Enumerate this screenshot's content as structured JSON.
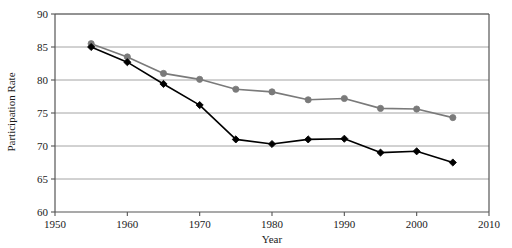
{
  "chart_data": {
    "type": "line",
    "title": "",
    "subtitle": "",
    "xlabel": "Year",
    "ylabel": "Participation Rate",
    "xlim": [
      1950,
      2010
    ],
    "ylim": [
      60,
      90
    ],
    "xticks": [
      1950,
      1960,
      1970,
      1980,
      1990,
      2000,
      2010
    ],
    "xtick_labels": [
      "1950",
      "1960",
      "1970",
      "1980",
      "1990",
      "2000",
      "2010"
    ],
    "yticks": [
      60,
      65,
      70,
      75,
      80,
      85,
      90
    ],
    "ytick_labels": [
      "60",
      "65",
      "70",
      "75",
      "80",
      "85",
      "90"
    ],
    "grid": "horizontal",
    "legend": "none",
    "x": [
      1955,
      1960,
      1965,
      1970,
      1975,
      1980,
      1985,
      1990,
      1995,
      2000,
      2005
    ],
    "series": [
      {
        "name": "gray-series",
        "color": "#7a7a7a",
        "marker": "circle",
        "values": [
          85.5,
          83.5,
          81.0,
          80.1,
          78.6,
          78.2,
          77.0,
          77.2,
          75.7,
          75.6,
          74.3
        ]
      },
      {
        "name": "black-series",
        "color": "#000000",
        "marker": "diamond",
        "values": [
          85.0,
          82.7,
          79.4,
          76.2,
          71.0,
          70.3,
          71.0,
          71.1,
          69.0,
          69.2,
          67.5
        ]
      }
    ],
    "axis_color": "#555555",
    "grid_color": "#9a9a9a",
    "plot_background": "#ffffff"
  }
}
